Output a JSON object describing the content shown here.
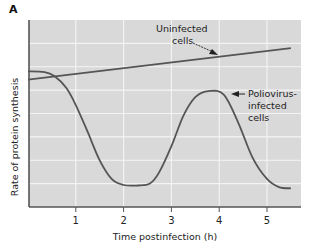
{
  "panel_label": "A",
  "colors": {
    "plot_bg": "#d9d9d9",
    "grid": "#f4f4f4",
    "axis": "#555555",
    "curve": "#555555",
    "text": "#222222"
  },
  "chart_data": {
    "type": "line",
    "title": "",
    "xlabel": "Time postinfection (h)",
    "ylabel": "Rate of protein synthesis",
    "xlim": [
      0,
      5.7
    ],
    "ylim": [
      0,
      8
    ],
    "xticks": [
      1,
      2,
      3,
      4,
      5
    ],
    "xtick_labels": [
      "1",
      "2",
      "3",
      "4",
      "5"
    ],
    "yticks_labeled": false,
    "grid": true,
    "legend": "inline annotations",
    "series": [
      {
        "name": "Uninfected cells",
        "x": [
          0,
          5.5
        ],
        "y": [
          5.45,
          6.8
        ]
      },
      {
        "name": "Poliovirus-infected cells",
        "x": [
          0,
          0.35,
          0.55,
          0.8,
          1.0,
          1.25,
          1.5,
          1.75,
          2.0,
          2.3,
          2.55,
          2.75,
          3.0,
          3.25,
          3.5,
          3.78,
          4.1,
          4.4,
          4.7,
          5.0,
          5.25,
          5.5
        ],
        "y": [
          5.8,
          5.77,
          5.6,
          5.1,
          4.36,
          3.2,
          2.0,
          1.2,
          0.94,
          0.92,
          1.0,
          1.5,
          2.6,
          3.9,
          4.7,
          4.96,
          4.8,
          3.6,
          2.1,
          1.2,
          0.85,
          0.8
        ]
      }
    ],
    "annotations": [
      {
        "text": [
          "Uninfected",
          "cells"
        ],
        "arrow_to": "Uninfected cells"
      },
      {
        "text": [
          "Poliovirus-",
          "infected",
          "cells"
        ],
        "arrow_to": "Poliovirus-infected cells"
      }
    ]
  },
  "annotations": {
    "uninfected": [
      "Uninfected",
      "cells"
    ],
    "infected": [
      "Poliovirus-",
      "infected",
      "cells"
    ]
  }
}
